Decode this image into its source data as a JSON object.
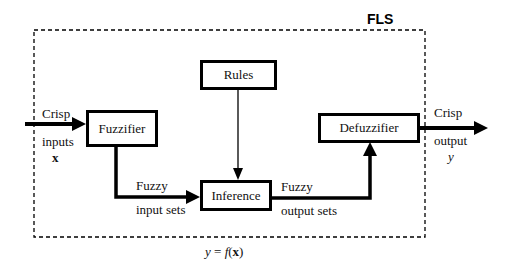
{
  "title": "FLS",
  "blocks": {
    "fuzzifier": "Fuzzifier",
    "rules": "Rules",
    "inference": "Inference",
    "defuzzifier": "Defuzzifier"
  },
  "labels": {
    "input_top": "Crisp",
    "input_mid": "inputs",
    "input_var": "x",
    "fuzzy_in_top": "Fuzzy",
    "fuzzy_in_bottom": "input sets",
    "fuzzy_out_top": "Fuzzy",
    "fuzzy_out_bottom": "output sets",
    "output_top": "Crisp",
    "output_mid": "output",
    "output_var": "y"
  },
  "formula": {
    "lhs": "y",
    "eq": " = ",
    "f": "f",
    "open": "(",
    "arg": "x",
    "close": ")"
  },
  "colors": {
    "line": "#000000",
    "background": "#ffffff"
  }
}
